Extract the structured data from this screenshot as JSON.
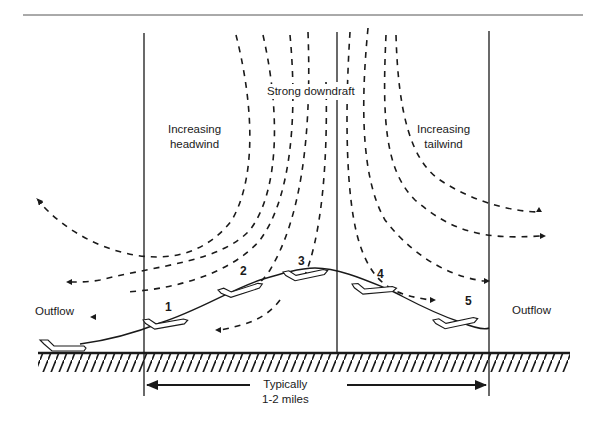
{
  "diagram": {
    "type": "microburst-wind-shear",
    "labels": {
      "strong_downdraft": "Strong downdraft",
      "increasing_headwind_1": "Increasing",
      "increasing_headwind_2": "headwind",
      "increasing_tailwind_1": "Increasing",
      "increasing_tailwind_2": "tailwind",
      "outflow_left": "Outflow",
      "outflow_right": "Outflow",
      "distance_1": "Typically",
      "distance_2": "1-2 miles"
    },
    "aircraft_positions": [
      "1",
      "2",
      "3",
      "4",
      "5"
    ],
    "colors": {
      "ink": "#1a1a1a",
      "background": "#ffffff"
    }
  }
}
